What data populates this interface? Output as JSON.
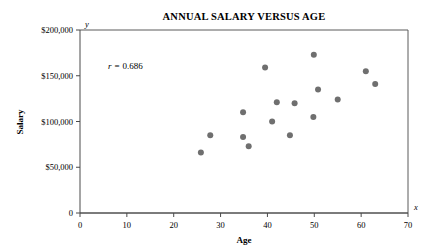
{
  "chart_data": {
    "type": "scatter",
    "title": "ANNUAL SALARY VERSUS AGE",
    "xlabel": "Age",
    "ylabel": "Salary",
    "x_axis_variable": "x",
    "y_axis_variable": "y",
    "xlim": [
      0,
      70
    ],
    "ylim": [
      0,
      200000
    ],
    "grid": false,
    "legend": null,
    "annotations": [
      {
        "name": "correlation-coefficient",
        "symbol": "r",
        "equals": "=",
        "value": "0.686",
        "text": "r = 0.686"
      }
    ],
    "x_ticks": [
      0,
      10,
      20,
      30,
      40,
      50,
      60,
      70
    ],
    "x_tick_labels": [
      "0",
      "10",
      "20",
      "30",
      "40",
      "50",
      "60",
      "70"
    ],
    "y_ticks": [
      0,
      50000,
      100000,
      150000,
      200000
    ],
    "y_tick_labels": [
      "0",
      "$50,000",
      "$100,000",
      "$150,000",
      "$200,000"
    ],
    "point_color": "#6f6f6f",
    "point_radius": 3,
    "x": [
      25.8,
      27.8,
      34.8,
      34.8,
      36.0,
      39.5,
      41.0,
      42.0,
      44.8,
      45.8,
      49.8,
      49.9,
      50.8,
      55.0,
      61.0,
      63.0
    ],
    "y": [
      66000,
      85000,
      110000,
      83000,
      73000,
      159000,
      100000,
      121000,
      85000,
      120000,
      105000,
      173000,
      135000,
      124000,
      155000,
      141000
    ],
    "points": [
      {
        "age": 25.8,
        "salary": 66000
      },
      {
        "age": 27.8,
        "salary": 85000
      },
      {
        "age": 34.8,
        "salary": 110000
      },
      {
        "age": 34.8,
        "salary": 83000
      },
      {
        "age": 36.0,
        "salary": 73000
      },
      {
        "age": 39.5,
        "salary": 159000
      },
      {
        "age": 41.0,
        "salary": 100000
      },
      {
        "age": 42.0,
        "salary": 121000
      },
      {
        "age": 44.8,
        "salary": 85000
      },
      {
        "age": 45.8,
        "salary": 120000
      },
      {
        "age": 49.8,
        "salary": 105000
      },
      {
        "age": 49.9,
        "salary": 173000
      },
      {
        "age": 50.8,
        "salary": 135000
      },
      {
        "age": 55.0,
        "salary": 124000
      },
      {
        "age": 61.0,
        "salary": 155000
      },
      {
        "age": 63.0,
        "salary": 141000
      }
    ]
  }
}
